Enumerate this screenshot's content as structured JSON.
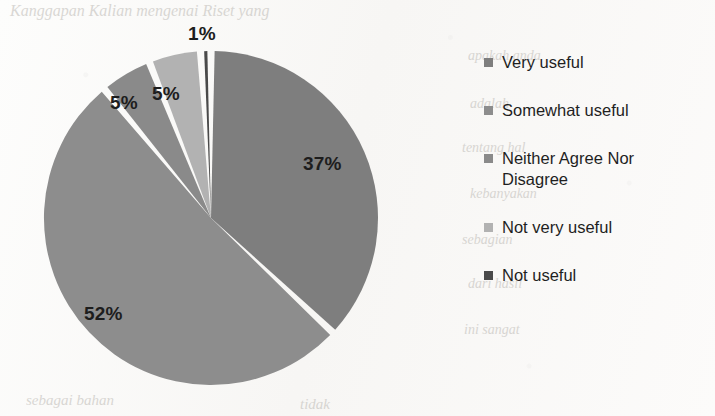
{
  "chart_data": {
    "type": "pie",
    "title": "",
    "categories": [
      "Very useful",
      "Somewhat useful",
      "Neither Agree Nor Disagree",
      "Not very useful",
      "Not useful"
    ],
    "values": [
      37,
      52,
      5,
      5,
      1
    ],
    "value_labels": [
      "37%",
      "52%",
      "5%",
      "5%",
      "1%"
    ],
    "units": "percent",
    "start_angle_deg": 0,
    "direction": "clockwise",
    "legend_position": "right",
    "grid": false,
    "slice_colors": [
      "#7e7e7e",
      "#8d8d8d",
      "#8a8a8a",
      "#b2b2b2",
      "#4a4a4a"
    ],
    "separator_color": "#ffffff"
  },
  "legend": {
    "items": [
      {
        "label": "Very useful",
        "color": "#7e7e7e"
      },
      {
        "label": "Somewhat useful",
        "color": "#8d8d8d"
      },
      {
        "label": "Neither Agree Nor Disagree",
        "color": "#8a8a8a"
      },
      {
        "label": "Not very useful",
        "color": "#b2b2b2"
      },
      {
        "label": "Not useful",
        "color": "#4a4a4a"
      }
    ]
  },
  "slice_labels": [
    {
      "text": "37%",
      "x": 303,
      "y": 153
    },
    {
      "text": "52%",
      "x": 84,
      "y": 303
    },
    {
      "text": "5%",
      "x": 152,
      "y": 83
    },
    {
      "text": "5%",
      "x": 110,
      "y": 92
    },
    {
      "text": "1%",
      "x": 188,
      "y": 23
    }
  ],
  "background_bleed": [
    {
      "text": "Kanggapan Kalian mengenai Riset yang",
      "x": 10,
      "y": 2,
      "size": 16
    },
    {
      "text": "apakah anda",
      "x": 468,
      "y": 48,
      "size": 14
    },
    {
      "text": "adalah",
      "x": 470,
      "y": 96,
      "size": 14
    },
    {
      "text": "tentang hal",
      "x": 462,
      "y": 140,
      "size": 14
    },
    {
      "text": "kebanyakan",
      "x": 470,
      "y": 186,
      "size": 14
    },
    {
      "text": "sebagian",
      "x": 462,
      "y": 232,
      "size": 14
    },
    {
      "text": "dari hasil",
      "x": 468,
      "y": 276,
      "size": 14
    },
    {
      "text": "ini sangat",
      "x": 464,
      "y": 322,
      "size": 14
    },
    {
      "text": "sebagai bahan",
      "x": 26,
      "y": 392,
      "size": 15
    },
    {
      "text": "tidak",
      "x": 300,
      "y": 396,
      "size": 15
    }
  ]
}
